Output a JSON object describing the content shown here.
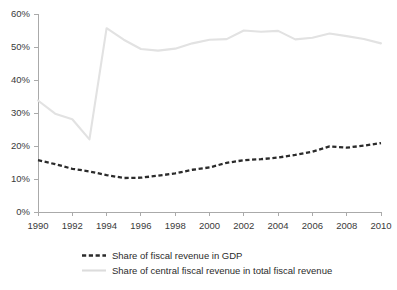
{
  "chart_data": {
    "type": "line",
    "title": "",
    "xlabel": "",
    "ylabel": "",
    "x": [
      1990,
      1991,
      1992,
      1993,
      1994,
      1995,
      1996,
      1997,
      1998,
      1999,
      2000,
      2001,
      2002,
      2003,
      2004,
      2005,
      2006,
      2007,
      2008,
      2009,
      2010
    ],
    "xlim": [
      1990,
      2010
    ],
    "ylim": [
      0,
      60
    ],
    "y_tick_values": [
      0,
      10,
      20,
      30,
      40,
      50,
      60
    ],
    "y_tick_labels": [
      "0%",
      "10%",
      "20%",
      "30%",
      "40%",
      "50%",
      "60%"
    ],
    "x_tick_values": [
      1990,
      1992,
      1994,
      1996,
      1998,
      2000,
      2002,
      2004,
      2006,
      2008,
      2010
    ],
    "x_tick_labels": [
      "1990",
      "1992",
      "1994",
      "1996",
      "1998",
      "2000",
      "2002",
      "2004",
      "2006",
      "2008",
      "2010"
    ],
    "grid": false,
    "legend_position": "bottom",
    "series": [
      {
        "name": "Share of fiscal revenue in GDP",
        "style": "dashed",
        "color": "#2b2b2b",
        "values": [
          15.7,
          14.5,
          13.1,
          12.3,
          11.2,
          10.3,
          10.4,
          11.0,
          11.7,
          12.8,
          13.5,
          14.9,
          15.7,
          16.0,
          16.5,
          17.3,
          18.3,
          19.9,
          19.5,
          20.1,
          20.9
        ]
      },
      {
        "name": "Share of central fiscal revenue in total fiscal revenue",
        "style": "solid",
        "color": "#e2e2e2",
        "values": [
          33.8,
          29.8,
          28.1,
          22.0,
          55.7,
          52.2,
          49.4,
          48.9,
          49.5,
          51.1,
          52.2,
          52.4,
          55.0,
          54.6,
          54.9,
          52.3,
          52.8,
          54.1,
          53.3,
          52.4,
          51.1
        ]
      }
    ]
  },
  "legend": {
    "items": [
      {
        "label": "Share of fiscal revenue in GDP",
        "style": "dashed",
        "color": "#2b2b2b"
      },
      {
        "label": "Share of central fiscal revenue in total fiscal revenue",
        "style": "solid",
        "color": "#dcdcdc"
      }
    ]
  },
  "colors": {
    "axis": "#aaaaaa",
    "tick_text": "#3a3a3a",
    "legend_text": "#2b2b2b",
    "background": "#ffffff"
  }
}
